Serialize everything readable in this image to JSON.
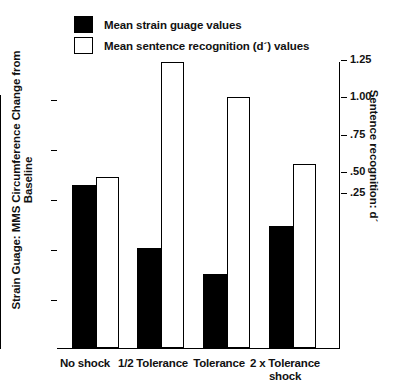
{
  "legend": {
    "items": [
      {
        "label": "Mean strain guage values",
        "swatch": "filled-square-icon",
        "color": "#000000"
      },
      {
        "label": "Mean sentence recognition (d´) values",
        "swatch": "hollow-square-icon",
        "color": "#ffffff"
      }
    ]
  },
  "axes": {
    "left_title": "Strain Guage: MMS Circumference Change from Baseline",
    "right_title": "Sentence recognition: d´",
    "left_ticks": [
      "25",
      "20",
      "15",
      "10",
      "5"
    ],
    "right_ticks": [
      "1.25",
      "1.00",
      ".75",
      ".50",
      ".25"
    ]
  },
  "chart_data": {
    "type": "bar",
    "title": "",
    "xlabel": "",
    "ylabel": "Strain Guage: MMS Circumference Change from Baseline",
    "y2label": "Sentence recognition: d´",
    "categories": [
      "No shock",
      "1/2 Tolerance",
      "Tolerance",
      "2 x Tolerance shock"
    ],
    "grid": false,
    "legend_position": "top-left",
    "ylim": [
      0,
      27.5
    ],
    "y2lim": [
      0,
      1.35
    ],
    "series": [
      {
        "name": "Mean strain guage values",
        "axis": "left",
        "color": "#000000",
        "style": "filled",
        "values": [
          16.2,
          9.8,
          7.3,
          12.3
        ]
      },
      {
        "name": "Mean sentence recognition (d´) values",
        "axis": "right",
        "color": "#ffffff",
        "style": "open",
        "values": [
          0.3,
          1.22,
          1.0,
          0.43
        ]
      }
    ]
  },
  "geometry": {
    "baseline_y": 348,
    "bars": [
      {
        "x": 72,
        "w": 24,
        "top": 185,
        "kind": "solid",
        "name": "bar-solid-no-shock"
      },
      {
        "x": 96,
        "w": 23,
        "top": 177,
        "kind": "open",
        "name": "bar-open-no-shock"
      },
      {
        "x": 137,
        "w": 24,
        "top": 248,
        "kind": "solid",
        "name": "bar-solid-half-tolerance"
      },
      {
        "x": 161,
        "w": 23,
        "top": 62,
        "kind": "open",
        "name": "bar-open-half-tolerance"
      },
      {
        "x": 203,
        "w": 24,
        "top": 274,
        "kind": "solid",
        "name": "bar-solid-tolerance"
      },
      {
        "x": 227,
        "w": 23,
        "top": 97,
        "kind": "open",
        "name": "bar-open-tolerance"
      },
      {
        "x": 269,
        "w": 24,
        "top": 226,
        "kind": "solid",
        "name": "bar-solid-2x-tolerance"
      },
      {
        "x": 293,
        "w": 23,
        "top": 164,
        "kind": "open",
        "name": "bar-open-2x-tolerance"
      }
    ],
    "left_tick_y": [
      100,
      150,
      200,
      250,
      300
    ],
    "right_tick_y": [
      60,
      97,
      135,
      172,
      193
    ],
    "category_x": [
      77,
      145,
      211,
      277
    ]
  }
}
